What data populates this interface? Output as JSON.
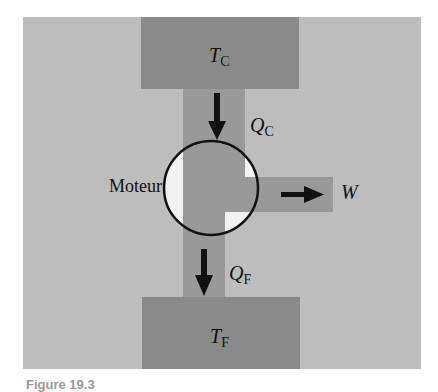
{
  "diagram": {
    "colors": {
      "background_panel": "#bdbdbd",
      "reservoir": "#8a8a8a",
      "channel": "#999999",
      "engine_highlight": "#f2f2f2",
      "ink": "#111111"
    },
    "hot_reservoir": {
      "symbol": "T",
      "subscript": "C"
    },
    "cold_reservoir": {
      "symbol": "T",
      "subscript": "F"
    },
    "heat_in": {
      "symbol": "Q",
      "subscript": "C"
    },
    "heat_out": {
      "symbol": "Q",
      "subscript": "F"
    },
    "work_out": {
      "symbol": "W"
    },
    "engine": {
      "label": "Moteur"
    },
    "caption": "Figure 19.3"
  }
}
